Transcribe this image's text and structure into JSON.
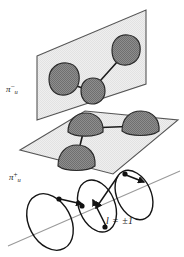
{
  "figure": {
    "background_color": "#ffffff",
    "labels": {
      "upper_plane": {
        "symbol": "π",
        "subscript": "u",
        "superscript": "−",
        "full_text": "πᵤ⁻"
      },
      "lower_plane": {
        "symbol": "π",
        "subscript": "u",
        "superscript": "+",
        "full_text": "πᵤ⁺"
      },
      "quantum_number": {
        "full_text": "l = ±1",
        "variable": "l",
        "equals": "=",
        "value": "±1"
      }
    },
    "colors": {
      "plane_fill": "#ededed",
      "plane_stroke": "#4a4a4a",
      "lobe_fill": "#8c8c8c",
      "lobe_stroke": "#2b2b2b",
      "bond_stroke": "#1a1a1a",
      "loop_stroke": "#141414",
      "axis_stroke": "#9a9a9a",
      "label_color": "#1a1a1a"
    },
    "upper_plane": {
      "name": "pi-u-minus-plane",
      "orientation": "vertical-tilted",
      "lobe_count": 3,
      "lobes": [
        {
          "id": "upper-lobe-left",
          "cx": 62,
          "cy": 80
        },
        {
          "id": "upper-lobe-center",
          "cx": 92,
          "cy": 91
        },
        {
          "id": "upper-lobe-right",
          "cx": 126,
          "cy": 50
        }
      ],
      "bonds": [
        {
          "from": "upper-lobe-left",
          "to": "upper-lobe-center"
        },
        {
          "from": "upper-lobe-center",
          "to": "upper-lobe-right"
        }
      ]
    },
    "lower_plane": {
      "name": "pi-u-plus-plane",
      "orientation": "horizontal-tilted",
      "lobe_count": 3,
      "lobes": [
        {
          "id": "lower-lobe-left",
          "cx": 84,
          "cy": 128
        },
        {
          "id": "lower-lobe-front",
          "cx": 76,
          "cy": 160
        },
        {
          "id": "lower-lobe-right",
          "cx": 139,
          "cy": 126
        }
      ],
      "bonds": [
        {
          "from": "lower-lobe-left",
          "to": "lower-lobe-right"
        },
        {
          "from": "lower-lobe-left",
          "to": "lower-lobe-front"
        }
      ]
    },
    "loops": {
      "name": "rotational-orbital-loops",
      "count": 3,
      "axis_label": "l = ±1",
      "items": [
        {
          "id": "loop-left",
          "cx": 50,
          "cy": 222
        },
        {
          "id": "loop-center",
          "cx": 97,
          "cy": 207
        },
        {
          "id": "loop-right",
          "cx": 134,
          "cy": 196
        }
      ],
      "arrow_count": 4,
      "marker_dot_count": 4
    }
  }
}
